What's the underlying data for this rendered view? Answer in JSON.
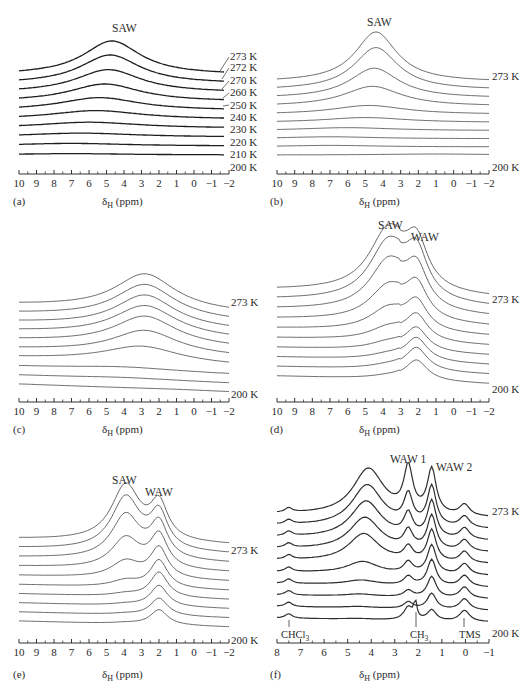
{
  "chart_data": [
    {
      "id": "a",
      "type": "line",
      "panel_label": "(a)",
      "xlabel": "δH (ppm)",
      "x_ticks": [
        10,
        9,
        8,
        7,
        6,
        5,
        4,
        3,
        2,
        1,
        0,
        -1,
        -2
      ],
      "xlim": [
        10,
        -2
      ],
      "annotations": [
        "SAW"
      ],
      "peaks_ppm": {
        "SAW": 4.7
      },
      "stacked": true,
      "line_color": "#1e1e1e",
      "series_labels": [
        "273 K",
        "272 K",
        "270 K",
        "260 K",
        "250 K",
        "240 K",
        "230 K",
        "220 K",
        "210 K",
        "200 K"
      ],
      "series": [
        {
          "name": "273 K",
          "peak_center": 4.7,
          "peak_height": 1.0,
          "width": 2.0
        },
        {
          "name": "272 K",
          "peak_center": 4.8,
          "peak_height": 0.85,
          "width": 2.1
        },
        {
          "name": "270 K",
          "peak_center": 4.9,
          "peak_height": 0.68,
          "width": 2.3
        },
        {
          "name": "260 K",
          "peak_center": 5.1,
          "peak_height": 0.52,
          "width": 2.5
        },
        {
          "name": "250 K",
          "peak_center": 5.4,
          "peak_height": 0.38,
          "width": 2.8
        },
        {
          "name": "240 K",
          "peak_center": 5.6,
          "peak_height": 0.26,
          "width": 3.2
        },
        {
          "name": "230 K",
          "peak_center": 6.0,
          "peak_height": 0.18,
          "width": 3.6
        },
        {
          "name": "220 K",
          "peak_center": 6.5,
          "peak_height": 0.12,
          "width": 4.0
        },
        {
          "name": "210 K",
          "peak_center": 7.0,
          "peak_height": 0.08,
          "width": 4.0
        },
        {
          "name": "200 K",
          "peak_center": 7.0,
          "peak_height": 0.04,
          "width": 4.0
        }
      ]
    },
    {
      "id": "b",
      "type": "line",
      "panel_label": "(b)",
      "xlabel": "δH (ppm)",
      "x_ticks": [
        10,
        9,
        8,
        7,
        6,
        5,
        4,
        3,
        2,
        1,
        0,
        -1,
        -2
      ],
      "xlim": [
        10,
        -2
      ],
      "annotations": [
        "SAW"
      ],
      "peaks_ppm": {
        "SAW": 4.4
      },
      "stacked": true,
      "line_color": "#6a6a6a",
      "series_labels": [
        "273 K",
        "200 K"
      ],
      "series": [
        {
          "name": "273 K",
          "peak_center": 4.4,
          "peak_height": 1.0,
          "width": 1.6
        },
        {
          "name": "s2",
          "peak_center": 4.4,
          "peak_height": 0.85,
          "width": 1.7
        },
        {
          "name": "s3",
          "peak_center": 4.5,
          "peak_height": 0.6,
          "width": 1.9
        },
        {
          "name": "s4",
          "peak_center": 4.6,
          "peak_height": 0.4,
          "width": 2.2
        },
        {
          "name": "s5",
          "peak_center": 4.8,
          "peak_height": 0.18,
          "width": 2.8
        },
        {
          "name": "s6",
          "peak_center": 5.0,
          "peak_height": 0.1,
          "width": 3.2
        },
        {
          "name": "s7",
          "peak_center": 6.0,
          "peak_height": 0.06,
          "width": 3.6
        },
        {
          "name": "s8",
          "peak_center": 7.0,
          "peak_height": 0.04,
          "width": 3.6
        },
        {
          "name": "s9",
          "peak_center": 7.0,
          "peak_height": 0.03,
          "width": 3.6
        },
        {
          "name": "200 K",
          "peak_center": 1.0,
          "peak_height": 0.02,
          "width": 4.0
        }
      ]
    },
    {
      "id": "c",
      "type": "line",
      "panel_label": "(c)",
      "xlabel": "δH (ppm)",
      "x_ticks": [
        10,
        9,
        8,
        7,
        6,
        5,
        4,
        3,
        2,
        1,
        0,
        -1,
        -2
      ],
      "xlim": [
        10,
        -2
      ],
      "annotations": [],
      "peaks_ppm": {
        "main": 2.8
      },
      "stacked": true,
      "line_color": "#6a6a6a",
      "series_labels": [
        "273 K",
        "200 K"
      ],
      "series": [
        {
          "name": "273 K",
          "peak_center": 2.8,
          "peak_height": 1.0,
          "width": 2.2
        },
        {
          "name": "s2",
          "peak_center": 2.8,
          "peak_height": 0.95,
          "width": 2.2
        },
        {
          "name": "s3",
          "peak_center": 2.8,
          "peak_height": 0.9,
          "width": 2.2
        },
        {
          "name": "s4",
          "peak_center": 2.8,
          "peak_height": 0.85,
          "width": 2.3
        },
        {
          "name": "s5",
          "peak_center": 2.8,
          "peak_height": 0.8,
          "width": 2.3
        },
        {
          "name": "s6",
          "peak_center": 2.8,
          "peak_height": 0.65,
          "width": 2.4
        },
        {
          "name": "s7",
          "peak_center": 3.0,
          "peak_height": 0.45,
          "width": 2.8
        },
        {
          "name": "s8",
          "peak_center": 4.0,
          "peak_height": 0.1,
          "width": 4.0
        },
        {
          "name": "s9",
          "peak_center": 4.0,
          "peak_height": 0.05,
          "width": 4.0
        },
        {
          "name": "200 K",
          "peak_center": 1.0,
          "peak_height": 0.02,
          "width": 4.0
        }
      ]
    },
    {
      "id": "d",
      "type": "line",
      "panel_label": "(d)",
      "xlabel": "δH (ppm)",
      "x_ticks": [
        10,
        9,
        8,
        7,
        6,
        5,
        4,
        3,
        2,
        1,
        0,
        -1,
        -2
      ],
      "xlim": [
        10,
        -2
      ],
      "annotations": [
        "SAW",
        "WAW"
      ],
      "peaks_ppm": {
        "SAW": 3.7,
        "WAW": 2.1
      },
      "stacked": true,
      "line_color": "#6a6a6a",
      "series_labels": [
        "273 K",
        "200 K"
      ],
      "series": [
        {
          "name": "273 K",
          "saw_height": 1.0,
          "waw_height": 0.85
        },
        {
          "name": "s2",
          "saw_height": 0.95,
          "waw_height": 0.85
        },
        {
          "name": "s3",
          "saw_height": 0.8,
          "waw_height": 0.75
        },
        {
          "name": "s4",
          "saw_height": 0.55,
          "waw_height": 0.65
        },
        {
          "name": "s5",
          "saw_height": 0.35,
          "waw_height": 0.55
        },
        {
          "name": "s6",
          "saw_height": 0.2,
          "waw_height": 0.5
        },
        {
          "name": "s7",
          "saw_height": 0.12,
          "waw_height": 0.45
        },
        {
          "name": "s8",
          "saw_height": 0.08,
          "waw_height": 0.45
        },
        {
          "name": "s9",
          "saw_height": 0.06,
          "waw_height": 0.45
        },
        {
          "name": "200 K",
          "saw_height": 0.04,
          "waw_height": 0.4
        }
      ]
    },
    {
      "id": "e",
      "type": "line",
      "panel_label": "(e)",
      "xlabel": "δH (ppm)",
      "x_ticks": [
        10,
        9,
        8,
        7,
        6,
        5,
        4,
        3,
        2,
        1,
        0,
        -1,
        -2
      ],
      "xlim": [
        10,
        -2
      ],
      "annotations": [
        "SAW",
        "WAW"
      ],
      "peaks_ppm": {
        "SAW": 3.9,
        "WAW": 2.0
      },
      "stacked": true,
      "line_color": "#6a6a6a",
      "series_labels": [
        "273 K",
        "200 K"
      ],
      "series": [
        {
          "name": "273 K",
          "saw_height": 1.0,
          "waw_height": 0.7
        },
        {
          "name": "s2",
          "saw_height": 0.95,
          "waw_height": 0.7
        },
        {
          "name": "s3",
          "saw_height": 0.8,
          "waw_height": 0.68
        },
        {
          "name": "s4",
          "saw_height": 0.55,
          "waw_height": 0.65
        },
        {
          "name": "s5",
          "saw_height": 0.3,
          "waw_height": 0.6
        },
        {
          "name": "s6",
          "saw_height": 0.12,
          "waw_height": 0.55
        },
        {
          "name": "s7",
          "saw_height": 0.05,
          "waw_height": 0.5
        },
        {
          "name": "s8",
          "saw_height": 0.03,
          "waw_height": 0.42
        },
        {
          "name": "s9",
          "saw_height": 0.02,
          "waw_height": 0.35
        },
        {
          "name": "200 K",
          "saw_height": 0.02,
          "waw_height": 0.3
        }
      ]
    },
    {
      "id": "f",
      "type": "line",
      "panel_label": "(f)",
      "xlabel": "δH (ppm)",
      "x_ticks": [
        8,
        7,
        6,
        5,
        4,
        3,
        2,
        1,
        0,
        -1
      ],
      "xlim": [
        8,
        -1
      ],
      "annotations": [
        "WAW 1",
        "WAW 2",
        "CHCl3",
        "CH3",
        "TMS"
      ],
      "peaks_ppm": {
        "SAW": 4.1,
        "WAW 1": 2.4,
        "WAW 2": 1.4,
        "CHCl3": 7.5,
        "CH3": 2.1,
        "TMS": 0.0
      },
      "stacked": true,
      "line_color": "#2e2e2e",
      "series_labels": [
        "273 K",
        "200 K"
      ],
      "series": [
        {
          "name": "273 K",
          "saw_height": 1.0,
          "waw1_height": 1.0,
          "waw2_height": 0.85
        },
        {
          "name": "s2",
          "saw_height": 0.9,
          "waw1_height": 0.65,
          "waw2_height": 0.75
        },
        {
          "name": "s3",
          "saw_height": 0.8,
          "waw1_height": 0.5,
          "waw2_height": 0.7
        },
        {
          "name": "s4",
          "saw_height": 0.7,
          "waw1_height": 0.4,
          "waw2_height": 0.65
        },
        {
          "name": "s5",
          "saw_height": 0.6,
          "waw1_height": 0.3,
          "waw2_height": 0.6
        },
        {
          "name": "s6",
          "saw_height": 0.25,
          "waw1_height": 0.25,
          "waw2_height": 0.55
        },
        {
          "name": "s7",
          "saw_height": 0.1,
          "waw1_height": 0.2,
          "waw2_height": 0.5
        },
        {
          "name": "s8",
          "saw_height": 0.05,
          "waw1_height": 0.15,
          "waw2_height": 0.4
        },
        {
          "name": "s9",
          "saw_height": 0.03,
          "waw1_height": 0.15,
          "waw2_height": 0.3
        },
        {
          "name": "200 K",
          "saw_height": 0.02,
          "waw1_height": 0.3,
          "waw2_height": 0.2
        }
      ]
    }
  ],
  "labels": {
    "a": {
      "panel": "(a)",
      "peak": "SAW",
      "xlabel_main": "δ",
      "xlabel_sub": "H",
      "xlabel_rest": " (ppm)",
      "temps": [
        "273 K",
        "272 K",
        "270 K",
        "260 K",
        "250 K",
        "240 K",
        "230 K",
        "220 K",
        "210 K",
        "200 K"
      ]
    },
    "b": {
      "panel": "(b)",
      "peak": "SAW",
      "xlabel_main": "δ",
      "xlabel_sub": "H",
      "xlabel_rest": " (ppm)",
      "top": "273 K",
      "bottom": "200 K"
    },
    "c": {
      "panel": "(c)",
      "xlabel_main": "δ",
      "xlabel_sub": "H",
      "xlabel_rest": " (ppm)",
      "top": "273 K",
      "bottom": "200 K"
    },
    "d": {
      "panel": "(d)",
      "peak1": "SAW",
      "peak2": "WAW",
      "xlabel_main": "δ",
      "xlabel_sub": "H",
      "xlabel_rest": " (ppm)",
      "top": "273 K",
      "bottom": "200 K"
    },
    "e": {
      "panel": "(e)",
      "peak1": "SAW",
      "peak2": "WAW",
      "xlabel_main": "δ",
      "xlabel_sub": "H",
      "xlabel_rest": " (ppm)",
      "top": "273 K",
      "bottom": "200 K"
    },
    "f": {
      "panel": "(f)",
      "peak1": "WAW 1",
      "peak2": "WAW 2",
      "ref1_main": "CHCl",
      "ref1_sub": "3",
      "ref2_main": "CH",
      "ref2_sub": "3",
      "ref3": "TMS",
      "xlabel_main": "δ",
      "xlabel_sub": "H",
      "xlabel_rest": " (ppm)",
      "top": "273 K",
      "bottom": "200 K"
    }
  },
  "ticks": {
    "wide": [
      "10",
      "9",
      "8",
      "7",
      "6",
      "5",
      "4",
      "3",
      "2",
      "1",
      "0",
      "−1",
      "−2"
    ],
    "f": [
      "8",
      "7",
      "6",
      "5",
      "4",
      "3",
      "2",
      "1",
      "0",
      "−1"
    ]
  }
}
